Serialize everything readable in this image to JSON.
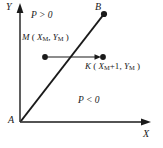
{
  "figure": {
    "background_color": "#ffffff",
    "stroke_color": "#1a1a1a"
  },
  "axes": {
    "y_label": "Y",
    "x_label": "X",
    "origin_label": "A"
  },
  "regions": [
    {
      "name": "above-line",
      "label": "P > 0"
    },
    {
      "name": "below-line",
      "label": "P < 0"
    }
  ],
  "points": {
    "b": {
      "label": "B",
      "x": 104,
      "y": 14
    },
    "m": {
      "label": "M",
      "x": 45,
      "y": 57,
      "coord_open": "(",
      "coord_x": "X",
      "coord_x_sub": "M",
      "coord_sep": ", ",
      "coord_y": "Y",
      "coord_y_sub": "M",
      "coord_close": ")"
    },
    "k": {
      "label": "K",
      "x": 103,
      "y": 57,
      "coord_open": "(",
      "coord_x": "X",
      "coord_x_sub": "M",
      "coord_plus": "+1",
      "coord_sep": ", ",
      "coord_y": "Y",
      "coord_y_sub": "M",
      "coord_close": ")"
    }
  },
  "labels": {
    "p_positive": "P > 0",
    "p_negative": "P < 0",
    "m_point": "M",
    "k_point": "K"
  }
}
